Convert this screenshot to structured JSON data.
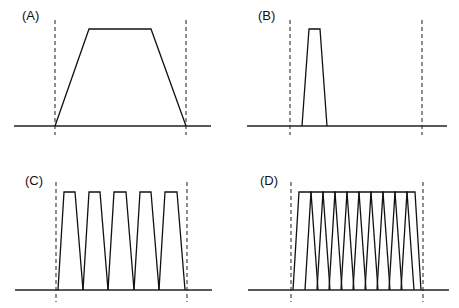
{
  "panels": [
    {
      "id": "A",
      "label": "(A)",
      "label_pos": [
        22,
        8
      ],
      "dashed_x": [
        55,
        186
      ],
      "dash_y": [
        20,
        135
      ],
      "baseline": {
        "x1": 14,
        "x2": 211,
        "y": 126
      },
      "top_y": 29,
      "pulses": [
        [
          55,
          89,
          151,
          186
        ]
      ]
    },
    {
      "id": "B",
      "label": "(B)",
      "label_pos": [
        258,
        8
      ],
      "dashed_x": [
        290,
        422
      ],
      "dash_y": [
        20,
        135
      ],
      "baseline": {
        "x1": 247,
        "x2": 447,
        "y": 126
      },
      "top_y": 29,
      "pulses": [
        [
          302,
          309,
          320,
          327
        ]
      ]
    },
    {
      "id": "C",
      "label": "(C)",
      "label_pos": [
        25,
        173
      ],
      "dashed_x": [
        56,
        187
      ],
      "dash_y": [
        182,
        302
      ],
      "baseline": {
        "x1": 15,
        "x2": 212,
        "y": 290
      },
      "top_y": 192,
      "pulses": [
        [
          58,
          64,
          75,
          83
        ],
        [
          83,
          89,
          100,
          108
        ],
        [
          108,
          114,
          126,
          134
        ],
        [
          134,
          140,
          151,
          159
        ],
        [
          159,
          165,
          177,
          185
        ]
      ]
    },
    {
      "id": "D",
      "label": "(D)",
      "label_pos": [
        260,
        173
      ],
      "dashed_x": [
        291,
        423
      ],
      "dash_y": [
        182,
        302
      ],
      "baseline": {
        "x1": 248,
        "x2": 449,
        "y": 290
      },
      "top_y": 192,
      "pulses": [
        [
          293,
          299,
          311,
          318
        ],
        [
          305,
          311,
          323,
          330
        ],
        [
          317,
          323,
          335,
          342
        ],
        [
          329,
          335,
          347,
          354
        ],
        [
          341,
          347,
          359,
          366
        ],
        [
          353,
          359,
          371,
          378
        ],
        [
          365,
          371,
          383,
          390
        ],
        [
          377,
          383,
          395,
          402
        ],
        [
          389,
          395,
          407,
          414
        ],
        [
          401,
          407,
          415,
          421
        ]
      ]
    }
  ]
}
